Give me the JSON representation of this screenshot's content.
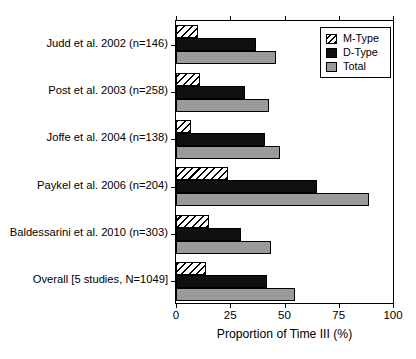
{
  "chart_data": {
    "type": "bar",
    "orientation": "horizontal",
    "title": "",
    "xlabel": "Proportion of Time III (%)",
    "ylabel": "",
    "xlim": [
      0,
      100
    ],
    "xticks": [
      0,
      25,
      50,
      75,
      100
    ],
    "xticklabels": [
      "0",
      "25",
      "50",
      "75",
      "100"
    ],
    "grid": false,
    "legend_position": "top-right",
    "categories": [
      "Judd et al. 2002 (n=146)",
      "Post et al. 2003 (n=258)",
      "Joffe et al. 2004 (n=138)",
      "Paykel et al. 2006 (n=204)",
      "Baldessarini et al. 2010 (n=303)",
      "Overall [5 studies, N=1049]"
    ],
    "series": [
      {
        "name": "M-Type",
        "fill": "hatched",
        "color": "#ffffff",
        "values": [
          10,
          11,
          7,
          24,
          15,
          14
        ]
      },
      {
        "name": "D-Type",
        "fill": "solid",
        "color": "#101010",
        "values": [
          37,
          32,
          41,
          65,
          30,
          42
        ]
      },
      {
        "name": "Total",
        "fill": "solid",
        "color": "#9a9a9a",
        "values": [
          46,
          43,
          48,
          89,
          44,
          55
        ]
      }
    ]
  },
  "legend": {
    "entries": [
      {
        "label": "M-Type"
      },
      {
        "label": "D-Type"
      },
      {
        "label": "Total"
      }
    ]
  },
  "colors": {
    "m_type": "#ffffff",
    "d_type": "#101010",
    "total": "#9a9a9a",
    "axis": "#000000",
    "background": "#ffffff"
  }
}
